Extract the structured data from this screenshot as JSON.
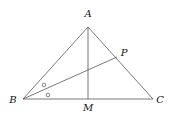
{
  "diagram": {
    "type": "geometry-triangle",
    "points": {
      "A": {
        "label": "A",
        "x": 88,
        "y": 27,
        "lx": 88,
        "ly": 17
      },
      "B": {
        "label": "B",
        "x": 23,
        "y": 99,
        "lx": 13,
        "ly": 103
      },
      "C": {
        "label": "C",
        "x": 153,
        "y": 99,
        "lx": 160,
        "ly": 103
      },
      "M": {
        "label": "M",
        "x": 88,
        "y": 99,
        "lx": 88,
        "ly": 111
      },
      "P": {
        "label": "P",
        "x": 117,
        "y": 57,
        "lx": 124,
        "ly": 56
      }
    },
    "segments": [
      [
        "A",
        "B"
      ],
      [
        "A",
        "C"
      ],
      [
        "B",
        "C"
      ],
      [
        "A",
        "M"
      ],
      [
        "B",
        "P"
      ]
    ],
    "angle_marks": [
      {
        "symbol": "circle",
        "x": 44,
        "y": 85
      },
      {
        "symbol": "circle",
        "x": 48,
        "y": 95
      }
    ],
    "stroke_color": "#555555"
  }
}
